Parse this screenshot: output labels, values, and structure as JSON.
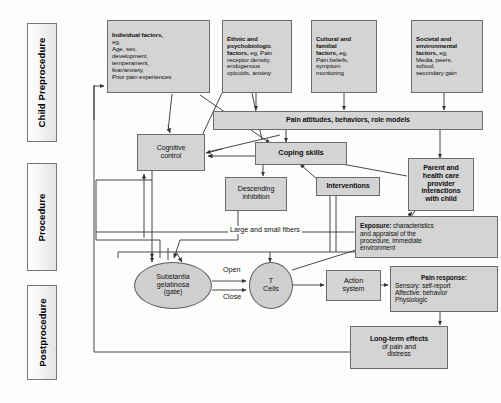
{
  "figure": {
    "type": "flowchart"
  },
  "phases": [
    {
      "id": "preprocedure",
      "label": "Child Preprocedure"
    },
    {
      "id": "procedure",
      "label": "Procedure"
    },
    {
      "id": "postprocedure",
      "label": "Postprocedure"
    }
  ],
  "nodes": {
    "individual_factors": {
      "lines": [
        {
          "text": "Individual factors,",
          "bold": true
        },
        {
          "text": "eg,",
          "bold": false
        },
        {
          "text": "Age, sex,",
          "bold": false
        },
        {
          "text": "development,",
          "bold": false
        },
        {
          "text": "temperament,",
          "bold": false
        },
        {
          "text": "fear/anxiety,",
          "bold": false
        },
        {
          "text": "Prior pain experiences",
          "bold": false
        }
      ]
    },
    "ethnic_factors": {
      "lines": [
        {
          "text": "Ethnic and",
          "bold": true
        },
        {
          "text": "psychobiologic",
          "bold": true
        },
        {
          "text": "factors,",
          "bold": true,
          "tail": " eg, Pain"
        },
        {
          "text": "receptor density,",
          "bold": false
        },
        {
          "text": "endogenous",
          "bold": false
        },
        {
          "text": "opicoids, anxiety",
          "bold": false
        }
      ]
    },
    "cultural_factors": {
      "lines": [
        {
          "text": "Cultural and",
          "bold": true
        },
        {
          "text": "familial",
          "bold": true
        },
        {
          "text": "factors,",
          "bold": true,
          "tail": " eg,"
        },
        {
          "text": "Pain beliefs,",
          "bold": false
        },
        {
          "text": "symptom",
          "bold": false
        },
        {
          "text": "monitoring",
          "bold": false
        }
      ]
    },
    "societal_factors": {
      "lines": [
        {
          "text": "Societal and",
          "bold": true
        },
        {
          "text": "environmental",
          "bold": true
        },
        {
          "text": "factors,",
          "bold": true,
          "tail": " eg,"
        },
        {
          "text": "Media, peers,",
          "bold": false
        },
        {
          "text": "school,",
          "bold": false
        },
        {
          "text": "secondary gain",
          "bold": false
        }
      ]
    },
    "pain_attitudes": {
      "label": "Pain attitudes, behaviors, role models"
    },
    "cognitive_control": {
      "line1": "Cognitive",
      "line2": "control"
    },
    "coping_skills": {
      "label": "Coping skills"
    },
    "descending_inhibition": {
      "line1": "Descending",
      "line2": "inhibition"
    },
    "interventions": {
      "label": "Interventions"
    },
    "parent_provider": {
      "lines": [
        {
          "text": "Parent and",
          "bold": true
        },
        {
          "text": "health care",
          "bold": true
        },
        {
          "text": "provider",
          "bold": true
        },
        {
          "text": "interactions",
          "bold": true
        },
        {
          "text": "with child",
          "bold": true
        }
      ]
    },
    "exposure": {
      "lines": [
        {
          "text": "Exposure:",
          "bold": true,
          "tail": " characteristics"
        },
        {
          "text": "and appraisal of the",
          "bold": false
        },
        {
          "text": "procedure, immediate",
          "bold": false
        },
        {
          "text": "environment",
          "bold": false
        }
      ]
    },
    "substantia_gelatinosa": {
      "line1": "Substantia",
      "line2": "gelatinosa",
      "line3": "(gate)"
    },
    "t_cells": {
      "line1": "T",
      "line2": "Cells"
    },
    "action_system": {
      "line1": "Action",
      "line2": "system"
    },
    "pain_response": {
      "lines": [
        {
          "text": "Pain response:",
          "bold": true
        },
        {
          "text": "Sensory: self-report",
          "bold": false
        },
        {
          "text": "Affective: behavior",
          "bold": false
        },
        {
          "text": "Physiologic",
          "bold": false
        }
      ]
    },
    "long_term_effects": {
      "lines": [
        {
          "text": "Long-term effects",
          "bold": true
        },
        {
          "text": "of pain and",
          "bold": false
        },
        {
          "text": "distress",
          "bold": false
        }
      ]
    }
  },
  "edge_labels": {
    "fibers": "Large and small fibers",
    "open": "Open",
    "close": "Close"
  },
  "colors": {
    "node_fill": "#d4d4d4",
    "ellipse_fill": "#cfcfcf",
    "node_border": "#6b6b6b",
    "phase_border": "#777777",
    "line": "#333333",
    "background": "#fdfdfc",
    "text": "#111111"
  }
}
